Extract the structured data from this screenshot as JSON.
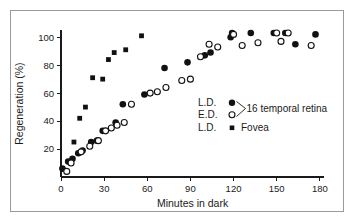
{
  "chart_data": {
    "type": "scatter",
    "title": "",
    "xlabel": "Minutes in dark",
    "ylabel": "Regeneration (%)",
    "xlim": [
      0,
      185
    ],
    "ylim": [
      0,
      108
    ],
    "xticks": [
      0,
      30,
      60,
      90,
      120,
      150,
      180
    ],
    "yticks": [
      20,
      40,
      60,
      80,
      100
    ],
    "grid": false,
    "legend_position": "inside-right",
    "series": [
      {
        "name": "L.D. 16 temporal retina",
        "marker": "filled-circle",
        "color": "#111111",
        "points": [
          [
            1,
            6
          ],
          [
            5,
            11
          ],
          [
            8,
            13
          ],
          [
            12,
            17
          ],
          [
            15,
            19
          ],
          [
            21,
            25
          ],
          [
            25,
            26
          ],
          [
            29,
            33
          ],
          [
            38,
            39
          ],
          [
            43,
            52
          ],
          [
            58,
            59
          ],
          [
            72,
            78
          ],
          [
            88,
            82
          ],
          [
            100,
            87
          ],
          [
            104,
            89
          ],
          [
            118,
            100
          ],
          [
            119,
            103
          ],
          [
            132,
            103
          ],
          [
            148,
            103
          ],
          [
            156,
            103
          ],
          [
            163,
            95
          ],
          [
            177,
            102
          ]
        ]
      },
      {
        "name": "E.D. 16 temporal retina",
        "marker": "open-circle",
        "color": "#111111",
        "points": [
          [
            4,
            4
          ],
          [
            7,
            10
          ],
          [
            14,
            18
          ],
          [
            20,
            22
          ],
          [
            26,
            26
          ],
          [
            31,
            33
          ],
          [
            35,
            35
          ],
          [
            39,
            37
          ],
          [
            44,
            39
          ],
          [
            49,
            52
          ],
          [
            62,
            60
          ],
          [
            67,
            61
          ],
          [
            73,
            64
          ],
          [
            84,
            69
          ],
          [
            90,
            70
          ],
          [
            97,
            86
          ],
          [
            103,
            95
          ],
          [
            109,
            93
          ],
          [
            120,
            102
          ],
          [
            126,
            94
          ],
          [
            137,
            96
          ],
          [
            150,
            103
          ],
          [
            153,
            97
          ],
          [
            158,
            103
          ],
          [
            174,
            94
          ]
        ]
      },
      {
        "name": "L.D. Fovea",
        "marker": "filled-square",
        "color": "#111111",
        "points": [
          [
            9,
            25
          ],
          [
            13,
            42
          ],
          [
            17,
            50
          ],
          [
            22,
            71
          ],
          [
            29,
            70
          ],
          [
            33,
            84
          ],
          [
            37,
            89
          ],
          [
            45,
            91
          ],
          [
            56,
            101
          ]
        ]
      }
    ]
  },
  "legend": {
    "row1_prefix": "L.D.",
    "row1_marker": "filled-circle-marker",
    "row2_prefix": "E.D.",
    "row2_marker": "open-circle-marker",
    "group_label": "16 temporal retina",
    "row3_prefix": "L.D.",
    "row3_marker": "filled-square-marker",
    "row3_label": "Fovea"
  },
  "axes": {
    "xlabel": "Minutes in dark",
    "ylabel": "Regeneration (%)",
    "xticklabels": [
      "0",
      "30",
      "60",
      "90",
      "120",
      "150",
      "180"
    ],
    "yticklabels": [
      "20",
      "40",
      "60",
      "80",
      "100"
    ]
  },
  "colors": {
    "marker": "#111111",
    "axis": "#1a1a1a",
    "frame": "#9a9a9a",
    "background": "#ffffff"
  }
}
